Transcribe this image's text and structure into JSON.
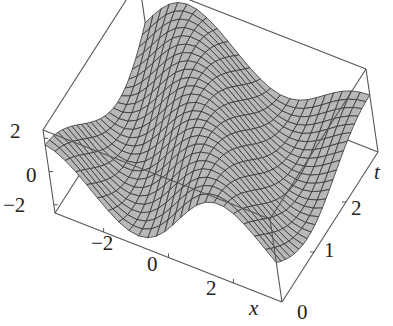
{
  "chart_data": {
    "type": "surface3d",
    "title": "",
    "xlabel": "x",
    "ylabel": "t",
    "zlabel": "",
    "x_range": [
      -3.5,
      3.5
    ],
    "t_range": [
      0,
      3
    ],
    "z_range": [
      -2.5,
      2.5
    ],
    "x_ticks": [
      "-2",
      "0",
      "2"
    ],
    "t_ticks": [
      "0",
      "1",
      "2"
    ],
    "z_ticks": [
      "2",
      "0",
      "-2"
    ],
    "mesh": {
      "nx": 24,
      "nt": 24
    },
    "surface_description": "Traveling wave u(x,t) with a ridge (crest ~2) running diagonally and a trough (~-2) opposite; box frame with mesh lines",
    "grid": false,
    "legend": null,
    "colors": {
      "surface": "#b8b8b8",
      "mesh": "#333333",
      "box": "#555555"
    }
  },
  "labels": {
    "z_ticks": [
      {
        "text": "2",
        "x": 10,
        "y": 121
      },
      {
        "text": "0",
        "x": 26,
        "y": 165
      },
      {
        "text": "−2",
        "x": 3,
        "y": 195
      }
    ],
    "x_ticks": [
      {
        "text": "−2",
        "x": 91,
        "y": 233
      },
      {
        "text": "0",
        "x": 147,
        "y": 254
      },
      {
        "text": "2",
        "x": 206,
        "y": 278
      }
    ],
    "t_ticks": [
      {
        "text": "0",
        "x": 297,
        "y": 302
      },
      {
        "text": "1",
        "x": 324,
        "y": 240
      },
      {
        "text": "2",
        "x": 351,
        "y": 198
      }
    ],
    "x_axis": {
      "text": "x",
      "x": 249,
      "y": 298
    },
    "t_axis": {
      "text": "t",
      "x": 374,
      "y": 162
    }
  }
}
